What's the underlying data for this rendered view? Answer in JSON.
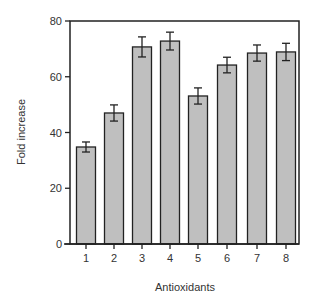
{
  "chart_data": {
    "type": "bar",
    "title": "",
    "xlabel": "Antioxidants",
    "ylabel": "Fold increase",
    "ylim": [
      0,
      80
    ],
    "yticks": [
      0,
      20,
      40,
      60,
      80
    ],
    "categories": [
      "1",
      "2",
      "3",
      "4",
      "5",
      "6",
      "7",
      "8"
    ],
    "values": [
      34.8,
      47.0,
      70.7,
      72.8,
      53.1,
      64.2,
      68.5,
      68.9
    ],
    "error": [
      1.8,
      2.9,
      3.6,
      3.2,
      2.9,
      2.8,
      2.9,
      3.1
    ],
    "grid": false,
    "legend": null,
    "colors": {
      "bar_fill": "#bfbfbf",
      "bar_stroke": "#222222",
      "axis": "#222222"
    }
  }
}
